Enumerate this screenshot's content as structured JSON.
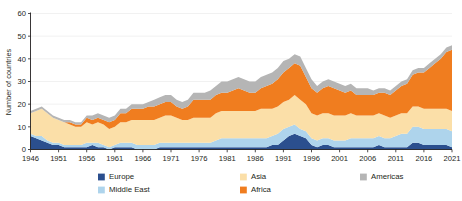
{
  "chart_data": {
    "type": "area",
    "stacked": true,
    "title": "",
    "subtitle": "",
    "xlabel": "",
    "ylabel": "Number of countries",
    "xlim": [
      1946,
      2021
    ],
    "ylim": [
      0,
      60
    ],
    "ytick_values": [
      0,
      10,
      20,
      30,
      40,
      50,
      60
    ],
    "ytick_labels": [
      "0",
      "10",
      "20",
      "30",
      "40",
      "50",
      "60"
    ],
    "xtick_values": [
      1946,
      1951,
      1956,
      1961,
      1966,
      1971,
      1976,
      1981,
      1986,
      1991,
      1996,
      2001,
      2006,
      2011,
      2016,
      2021
    ],
    "xtick_labels": [
      "1946",
      "1951",
      "1956",
      "1961",
      "1966",
      "1971",
      "1976",
      "1981",
      "1986",
      "1991",
      "1996",
      "2001",
      "2006",
      "2011",
      "2016",
      "2021"
    ],
    "grid": true,
    "grid_axis": "y",
    "legend_position": "bottom",
    "legend_entries": [
      "Europe",
      "Middle East",
      "Asia",
      "Africa",
      "Americas"
    ],
    "colors": {
      "Europe": "#2b4f8e",
      "Middle East": "#aed4ec",
      "Asia": "#fbdfa8",
      "Africa": "#f07d1f",
      "Americas": "#b5b5b5"
    },
    "x": [
      1946,
      1947,
      1948,
      1949,
      1950,
      1951,
      1952,
      1953,
      1954,
      1955,
      1956,
      1957,
      1958,
      1959,
      1960,
      1961,
      1962,
      1963,
      1964,
      1965,
      1966,
      1967,
      1968,
      1969,
      1970,
      1971,
      1972,
      1973,
      1974,
      1975,
      1976,
      1977,
      1978,
      1979,
      1980,
      1981,
      1982,
      1983,
      1984,
      1985,
      1986,
      1987,
      1988,
      1989,
      1990,
      1991,
      1992,
      1993,
      1994,
      1995,
      1996,
      1997,
      1998,
      1999,
      2000,
      2001,
      2002,
      2003,
      2004,
      2005,
      2006,
      2007,
      2008,
      2009,
      2010,
      2011,
      2012,
      2013,
      2014,
      2015,
      2016,
      2017,
      2018,
      2019,
      2020,
      2021
    ],
    "series": [
      {
        "name": "Europe",
        "color": "#2b4f8e",
        "values": [
          6,
          5,
          4,
          3,
          2,
          2,
          1,
          1,
          1,
          1,
          1,
          2,
          1,
          1,
          0,
          1,
          1,
          1,
          1,
          0,
          0,
          0,
          0,
          1,
          1,
          1,
          1,
          1,
          1,
          1,
          1,
          1,
          1,
          1,
          1,
          1,
          1,
          1,
          1,
          1,
          1,
          1,
          1,
          2,
          2,
          4,
          6,
          7,
          6,
          5,
          2,
          1,
          2,
          2,
          1,
          1,
          1,
          1,
          1,
          1,
          1,
          1,
          2,
          1,
          1,
          1,
          1,
          1,
          3,
          3,
          2,
          2,
          2,
          2,
          2,
          1
        ]
      },
      {
        "name": "Middle East",
        "color": "#aed4ec",
        "values": [
          1,
          1,
          2,
          1,
          1,
          1,
          1,
          1,
          1,
          1,
          2,
          1,
          2,
          1,
          1,
          1,
          2,
          2,
          2,
          2,
          2,
          2,
          2,
          2,
          2,
          2,
          2,
          2,
          2,
          2,
          2,
          2,
          2,
          3,
          4,
          4,
          4,
          4,
          4,
          4,
          4,
          4,
          4,
          4,
          5,
          5,
          4,
          4,
          3,
          3,
          3,
          3,
          3,
          3,
          3,
          3,
          3,
          4,
          4,
          4,
          4,
          4,
          4,
          4,
          4,
          5,
          6,
          6,
          7,
          7,
          7,
          7,
          7,
          7,
          7,
          7
        ]
      },
      {
        "name": "Asia",
        "color": "#fbdfa8",
        "values": [
          9,
          11,
          12,
          12,
          11,
          10,
          10,
          9,
          8,
          8,
          9,
          8,
          9,
          9,
          8,
          8,
          9,
          9,
          10,
          11,
          11,
          11,
          11,
          11,
          12,
          12,
          11,
          10,
          10,
          11,
          11,
          11,
          11,
          12,
          12,
          12,
          12,
          12,
          12,
          12,
          12,
          13,
          13,
          12,
          12,
          12,
          12,
          13,
          13,
          12,
          11,
          11,
          11,
          11,
          11,
          11,
          11,
          11,
          10,
          10,
          10,
          10,
          10,
          10,
          9,
          9,
          9,
          9,
          9,
          9,
          9,
          9,
          9,
          9,
          9,
          9
        ]
      },
      {
        "name": "Africa",
        "color": "#f07d1f",
        "values": [
          0,
          0,
          0,
          0,
          0,
          0,
          0,
          1,
          1,
          1,
          2,
          2,
          2,
          2,
          3,
          3,
          4,
          4,
          5,
          5,
          5,
          6,
          6,
          6,
          6,
          6,
          5,
          5,
          6,
          8,
          8,
          8,
          8,
          8,
          8,
          8,
          9,
          10,
          9,
          8,
          8,
          9,
          10,
          11,
          12,
          13,
          14,
          14,
          15,
          12,
          11,
          10,
          11,
          12,
          12,
          11,
          10,
          10,
          9,
          9,
          9,
          9,
          9,
          10,
          10,
          11,
          12,
          13,
          14,
          15,
          16,
          18,
          20,
          22,
          25,
          27
        ]
      },
      {
        "name": "Americas",
        "color": "#b5b5b5",
        "values": [
          1,
          1,
          1,
          1,
          1,
          1,
          1,
          1,
          1,
          1,
          1,
          2,
          2,
          2,
          2,
          2,
          2,
          2,
          2,
          2,
          2,
          2,
          3,
          3,
          3,
          3,
          3,
          3,
          3,
          3,
          3,
          3,
          4,
          4,
          5,
          5,
          5,
          5,
          5,
          5,
          5,
          5,
          5,
          5,
          5,
          5,
          4,
          4,
          4,
          4,
          4,
          3,
          3,
          3,
          3,
          3,
          3,
          3,
          3,
          3,
          3,
          2,
          2,
          2,
          2,
          2,
          2,
          2,
          2,
          2,
          2,
          2,
          2,
          2,
          2,
          2
        ]
      }
    ],
    "totals": [
      17,
      18,
      19,
      17,
      15,
      14,
      13,
      13,
      12,
      12,
      15,
      15,
      16,
      15,
      14,
      15,
      18,
      18,
      20,
      20,
      20,
      21,
      22,
      23,
      24,
      24,
      22,
      21,
      22,
      25,
      25,
      25,
      26,
      28,
      30,
      30,
      31,
      32,
      31,
      30,
      30,
      32,
      33,
      34,
      36,
      39,
      40,
      42,
      41,
      36,
      31,
      28,
      30,
      31,
      30,
      29,
      28,
      29,
      27,
      27,
      27,
      26,
      27,
      27,
      26,
      28,
      30,
      31,
      35,
      36,
      36,
      38,
      40,
      42,
      45,
      46
    ]
  },
  "legend": {
    "items": [
      {
        "label": "Europe",
        "color": "#2b4f8e",
        "col": 0,
        "row": 0
      },
      {
        "label": "Middle East",
        "color": "#aed4ec",
        "col": 0,
        "row": 1
      },
      {
        "label": "Asia",
        "color": "#fbdfa8",
        "col": 1,
        "row": 0
      },
      {
        "label": "Africa",
        "color": "#f07d1f",
        "col": 1,
        "row": 1
      },
      {
        "label": "Americas",
        "color": "#b5b5b5",
        "col": 2,
        "row": 0
      }
    ]
  },
  "axis": {
    "y_title": "Number of countries"
  }
}
